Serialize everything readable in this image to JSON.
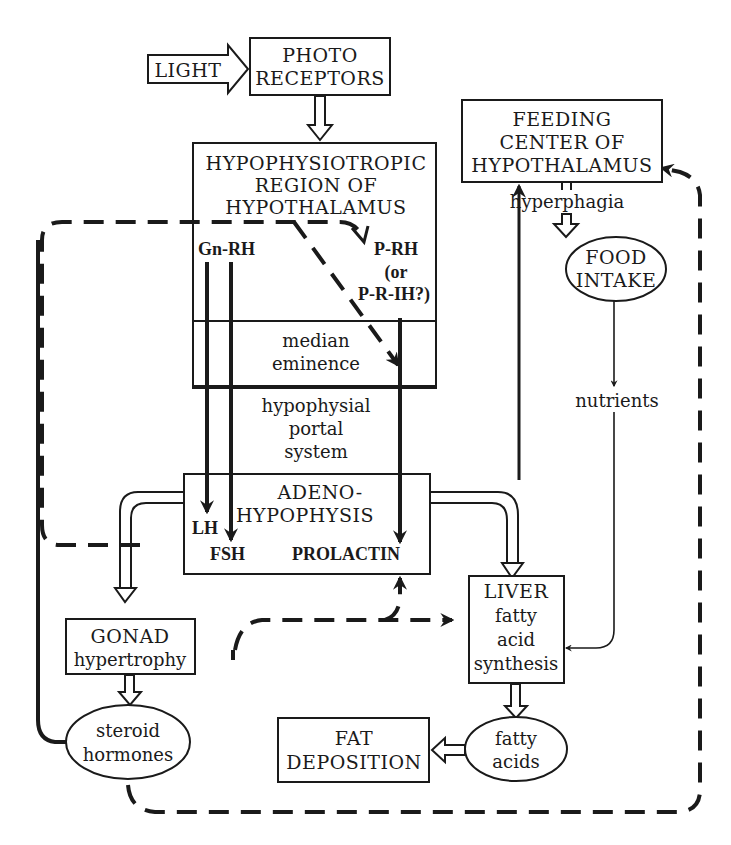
{
  "diagram": {
    "nodes": {
      "light": {
        "label": "LIGHT"
      },
      "photoreceptors": {
        "line1": "PHOTO",
        "line2": "RECEPTORS"
      },
      "hypophysiotropic": {
        "line1": "HYPOPHYSIOTROPIC",
        "line2": "REGION OF",
        "line3": "HYPOTHALAMUS"
      },
      "gnrh": {
        "label": "Gn-RH"
      },
      "prh": {
        "line1": "P-RH",
        "line2": "(or",
        "line3": "P-R-IH?)"
      },
      "median_eminence": {
        "line1": "median",
        "line2": "eminence"
      },
      "portal_system": {
        "line1": "hypophysial",
        "line2": "portal",
        "line3": "system"
      },
      "adenohypophysis": {
        "line1": "ADENO-",
        "line2": "HYPOPHYSIS"
      },
      "lh": {
        "label": "LH"
      },
      "fsh": {
        "label": "FSH"
      },
      "prolactin": {
        "label": "PROLACTIN"
      },
      "feeding_center": {
        "line1": "FEEDING",
        "line2": "CENTER OF",
        "line3": "HYPOTHALAMUS"
      },
      "hyperphagia": {
        "label": "hyperphagia"
      },
      "food_intake": {
        "line1": "FOOD",
        "line2": "INTAKE"
      },
      "nutrients": {
        "label": "nutrients"
      },
      "liver": {
        "line1": "LIVER",
        "line2": "fatty",
        "line3": "acid",
        "line4": "synthesis"
      },
      "gonad": {
        "line1": "GONAD",
        "line2": "hypertrophy"
      },
      "steroid_hormones": {
        "line1": "steroid",
        "line2": "hormones"
      },
      "fatty_acids": {
        "line1": "fatty",
        "line2": "acids"
      },
      "fat_deposition": {
        "line1": "FAT",
        "line2": "DEPOSITION"
      }
    },
    "edges": [
      {
        "from": "LIGHT",
        "to": "PHOTO RECEPTORS",
        "style": "open-arrow"
      },
      {
        "from": "PHOTO RECEPTORS",
        "to": "HYPOPHYSIOTROPIC REGION OF HYPOTHALAMUS",
        "style": "open-arrow"
      },
      {
        "from": "Gn-RH",
        "to": "LH",
        "style": "thick"
      },
      {
        "from": "Gn-RH",
        "to": "FSH",
        "style": "thick"
      },
      {
        "from": "P-RH (or P-R-IH?)",
        "to": "PROLACTIN",
        "style": "thick"
      },
      {
        "from": "ADENO-HYPOPHYSIS",
        "to": "GONAD hypertrophy",
        "style": "open-arrow"
      },
      {
        "from": "ADENO-HYPOPHYSIS",
        "to": "LIVER",
        "style": "open-arrow"
      },
      {
        "from": "LIVER",
        "to": "FEEDING CENTER OF HYPOTHALAMUS",
        "style": "thin-solid"
      },
      {
        "from": "FEEDING CENTER OF HYPOTHALAMUS",
        "to": "FOOD INTAKE",
        "style": "open-arrow",
        "label": "hyperphagia"
      },
      {
        "from": "FOOD INTAKE",
        "to": "LIVER",
        "style": "thin",
        "label": "nutrients"
      },
      {
        "from": "GONAD hypertrophy",
        "to": "steroid hormones",
        "style": "open-arrow"
      },
      {
        "from": "steroid hormones",
        "to": "HYPOPHYSIOTROPIC REGION (P-RH) / median eminence",
        "style": "dashed"
      },
      {
        "from": "steroid hormones",
        "to": "PROLACTIN",
        "style": "dashed"
      },
      {
        "from": "steroid hormones",
        "to": "LIVER",
        "style": "dashed"
      },
      {
        "from": "steroid hormones",
        "to": "FEEDING CENTER OF HYPOTHALAMUS",
        "style": "dashed"
      },
      {
        "from": "LIVER",
        "to": "fatty acids",
        "style": "open-arrow"
      },
      {
        "from": "fatty acids",
        "to": "FAT DEPOSITION",
        "style": "open-arrow"
      }
    ]
  }
}
